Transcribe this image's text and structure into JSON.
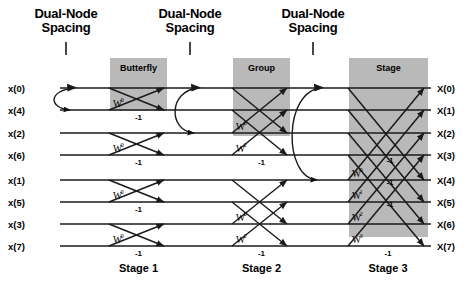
{
  "diagram": {
    "title_annotations": [
      {
        "label": "Dual-Node\nSpacing",
        "line1": "Dual-Node",
        "line2": "Spacing",
        "x": 66,
        "span_rows": 1
      },
      {
        "label": "Dual-Node Spacing",
        "line1": "Dual-Node",
        "line2": "Spacing",
        "x": 190,
        "span_rows": 2
      },
      {
        "label": "Dual-Node Spacing",
        "line1": "Dual-Node",
        "line2": "Spacing",
        "x": 313,
        "span_rows": 4
      }
    ],
    "dual_node_label_line1": "Dual-Node",
    "dual_node_label_line2": "Spacing",
    "inputs": [
      "x(0)",
      "x(4)",
      "x(2)",
      "x(6)",
      "x(1)",
      "x(5)",
      "x(3)",
      "x(7)"
    ],
    "outputs": [
      "X(0)",
      "X(1)",
      "X(2)",
      "X(3)",
      "X(4)",
      "X(5)",
      "X(6)",
      "X(7)"
    ],
    "stage_labels": [
      "Stage 1",
      "Stage 2",
      "Stage 3"
    ],
    "highlight_boxes": [
      {
        "label": "Butterfly",
        "x": 110,
        "y": 58,
        "w": 57,
        "h": 53
      },
      {
        "label": "Group",
        "x": 233,
        "y": 58,
        "w": 57,
        "h": 78
      },
      {
        "label": "Stage",
        "x": 349,
        "y": 58,
        "w": 79,
        "h": 179
      }
    ],
    "minus_one_label": "-1",
    "twiddle_base": "W",
    "stage1_twiddles": [
      "0",
      "0",
      "0",
      "0"
    ],
    "stage2_twiddles": [
      "0",
      "2",
      "0",
      "2"
    ],
    "stage3_twiddles": [
      "0",
      "1",
      "2",
      "3"
    ],
    "stage1_minus_count": 4,
    "stage2_minus_count": 4,
    "stage3_minus_count": 4,
    "colors": {
      "background": "#ffffff",
      "line": "#1a1a1a",
      "highlight_fill": "#b9b9b9",
      "text": "#000000"
    },
    "geometry": {
      "row_y": [
        88,
        110,
        133,
        155,
        180,
        202,
        224,
        246
      ],
      "stage1_x": [
        109,
        168
      ],
      "stage2_x": [
        232,
        291
      ],
      "stage3_x": [
        348,
        428
      ],
      "input_x": 8,
      "output_x": 437,
      "left_rail_x": 60
    }
  }
}
